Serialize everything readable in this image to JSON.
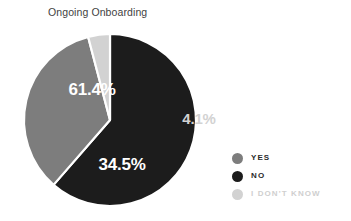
{
  "chart_data": {
    "type": "pie",
    "title": "Ongoing Onboarding",
    "categories": [
      "NO",
      "YES",
      "I DON'T KNOW"
    ],
    "values": [
      61.4,
      34.5,
      4.1
    ],
    "value_labels": [
      "61.4%",
      "34.5%",
      "4.1%"
    ],
    "colors": [
      "#1c1c1c",
      "#7d7d7d",
      "#d2d2d2"
    ],
    "label_colors": [
      "#ffffff",
      "#ffffff",
      "#d2d2d2"
    ],
    "legend_position": "right",
    "grid": false,
    "xlabel": "",
    "ylabel": "",
    "start_angle_deg": 0,
    "direction": "clockwise",
    "separator_color": "#ffffff",
    "background": "#ffffff",
    "slices": [
      {
        "name": "NO",
        "value": 61.4,
        "label": "61.4%",
        "color": "#1c1c1c",
        "label_color": "#ffffff",
        "label_x": 92,
        "label_y": 91,
        "label_placement": "inside"
      },
      {
        "name": "YES",
        "value": 34.5,
        "label": "34.5%",
        "color": "#7d7d7d",
        "label_color": "#ffffff",
        "label_x": 122,
        "label_y": 166,
        "label_placement": "inside"
      },
      {
        "name": "I DON'T KNOW",
        "value": 4.1,
        "label": "4.1%",
        "color": "#d2d2d2",
        "label_color": "#d2d2d2",
        "label_x": 199,
        "label_y": 120,
        "label_placement": "outside"
      }
    ]
  },
  "legend": {
    "items": [
      {
        "label": "YES",
        "color": "#7d7d7d",
        "text_color": "#2b2b2b"
      },
      {
        "label": "NO",
        "color": "#1c1c1c",
        "text_color": "#2b2b2b"
      },
      {
        "label": "I DON'T KNOW",
        "color": "#d2d2d2",
        "text_color": "#cfcfcf"
      }
    ]
  }
}
